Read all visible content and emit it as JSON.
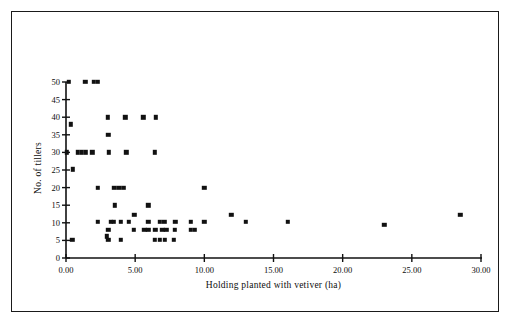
{
  "figure": {
    "frame_color": "#1a1a1a",
    "background_color": "#ffffff",
    "marker_color": "#111111"
  },
  "chart_data": {
    "type": "scatter",
    "title": "",
    "xlabel": "Holding planted with vetiver (ha)",
    "ylabel": "No. of tillers",
    "xlim": [
      0,
      30
    ],
    "ylim": [
      0,
      50
    ],
    "grid": false,
    "legend": null,
    "xticks": [
      0,
      5,
      10,
      15,
      20,
      25,
      30
    ],
    "xtick_labels": [
      "0.00",
      "5.00",
      "10.00",
      "15.00",
      "20.00",
      "25.00",
      "30.00"
    ],
    "yticks": [
      0,
      5,
      10,
      15,
      20,
      25,
      30,
      35,
      40,
      45,
      50
    ],
    "ytick_labels": [
      "0",
      "5",
      "10",
      "15",
      "20",
      "25",
      "30",
      "35",
      "40",
      "45",
      "50"
    ],
    "marker": "square",
    "points": [
      [
        0.2,
        50.0
      ],
      [
        1.4,
        50.0
      ],
      [
        2.0,
        50.0
      ],
      [
        2.3,
        50.0
      ],
      [
        0.35,
        38.0
      ],
      [
        3.0,
        40.0
      ],
      [
        4.3,
        40.0
      ],
      [
        5.6,
        40.0
      ],
      [
        6.5,
        40.0
      ],
      [
        3.05,
        35.0
      ],
      [
        0.05,
        30.0
      ],
      [
        0.85,
        30.0
      ],
      [
        1.15,
        30.0
      ],
      [
        1.45,
        30.0
      ],
      [
        1.9,
        30.0
      ],
      [
        3.1,
        30.0
      ],
      [
        4.35,
        30.0
      ],
      [
        6.4,
        30.0
      ],
      [
        0.5,
        25.2
      ],
      [
        2.3,
        20.0
      ],
      [
        3.5,
        20.0
      ],
      [
        3.85,
        20.0
      ],
      [
        4.2,
        20.0
      ],
      [
        10.0,
        20.0
      ],
      [
        3.55,
        15.0
      ],
      [
        5.95,
        15.0
      ],
      [
        4.95,
        12.2
      ],
      [
        11.95,
        12.3
      ],
      [
        28.5,
        12.3
      ],
      [
        2.3,
        10.2
      ],
      [
        3.25,
        10.2
      ],
      [
        3.45,
        10.2
      ],
      [
        3.95,
        10.2
      ],
      [
        4.55,
        10.2
      ],
      [
        5.95,
        10.2
      ],
      [
        6.8,
        10.2
      ],
      [
        7.1,
        10.2
      ],
      [
        7.9,
        10.2
      ],
      [
        9.0,
        10.2
      ],
      [
        10.0,
        10.2
      ],
      [
        13.0,
        10.2
      ],
      [
        16.05,
        10.2
      ],
      [
        23.0,
        9.4
      ],
      [
        3.05,
        8.0
      ],
      [
        4.9,
        8.0
      ],
      [
        5.65,
        8.0
      ],
      [
        5.95,
        8.0
      ],
      [
        6.45,
        8.0
      ],
      [
        6.95,
        8.0
      ],
      [
        7.25,
        8.0
      ],
      [
        7.85,
        8.0
      ],
      [
        9.0,
        8.0
      ],
      [
        9.3,
        8.0
      ],
      [
        0.45,
        5.2
      ],
      [
        2.95,
        6.2
      ],
      [
        3.05,
        5.2
      ],
      [
        3.95,
        5.2
      ],
      [
        6.4,
        5.2
      ],
      [
        6.8,
        5.2
      ],
      [
        7.15,
        5.2
      ],
      [
        7.8,
        5.2
      ]
    ]
  }
}
